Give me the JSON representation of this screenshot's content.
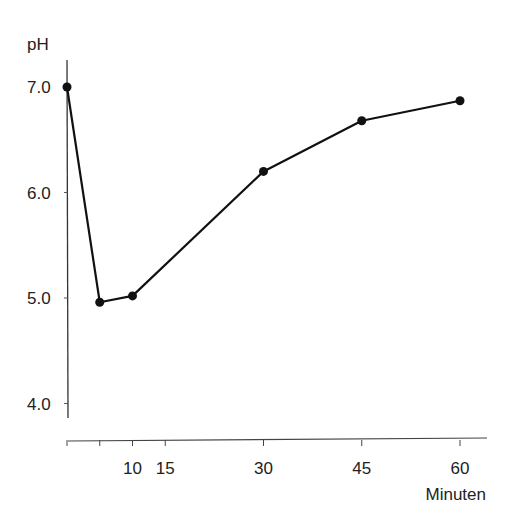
{
  "chart_data": {
    "type": "line",
    "title": "",
    "xlabel": "Minuten",
    "ylabel": "pH",
    "x": [
      0,
      5,
      10,
      30,
      45,
      60
    ],
    "series": [
      {
        "name": "pH",
        "values": [
          7.0,
          4.96,
          5.02,
          6.2,
          6.68,
          6.87
        ]
      }
    ],
    "x_ticks": [
      0,
      5,
      10,
      15,
      30,
      45,
      60
    ],
    "x_tick_labels": [
      "",
      "",
      "10",
      "15",
      "30",
      "45",
      "60"
    ],
    "y_ticks": [
      4.0,
      5.0,
      6.0,
      7.0
    ],
    "y_tick_labels": [
      "4.0",
      "5.0",
      "6.0",
      "7.0"
    ],
    "xlim": [
      0,
      63
    ],
    "ylim": [
      3.8,
      7.25
    ],
    "grid": false,
    "legend": "none"
  }
}
